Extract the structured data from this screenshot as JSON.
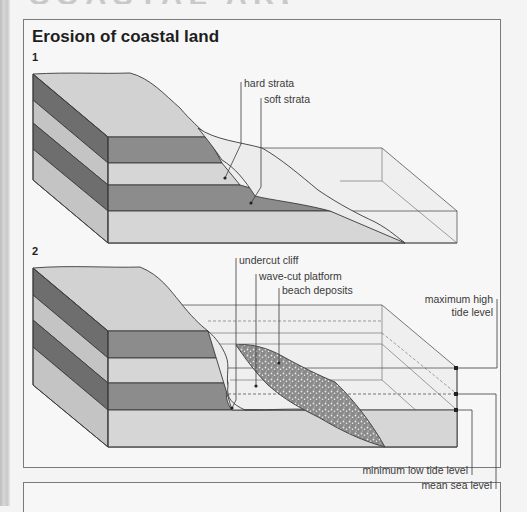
{
  "page": {
    "title": "Erosion of coastal land",
    "top_fragment": "COASTAL AREAS"
  },
  "colors": {
    "dark_strata": "#8c8c8c",
    "dark_strata_side": "#6e6e6e",
    "light_strata": "#d6d6d6",
    "light_strata_side": "#c4c4c4",
    "top_surface": "#d2d2d2",
    "water": "#ececec",
    "beach": "#9a9a9a",
    "outline": "#3a3a3a"
  },
  "diagrams": [
    {
      "number": "1",
      "labels": [
        {
          "id": "hard-strata",
          "text": "hard strata"
        },
        {
          "id": "soft-strata",
          "text": "soft strata"
        }
      ]
    },
    {
      "number": "2",
      "labels": [
        {
          "id": "undercut-cliff",
          "text": "undercut cliff"
        },
        {
          "id": "wave-cut-platform",
          "text": "wave-cut platform"
        },
        {
          "id": "beach-deposits",
          "text": "beach deposits"
        },
        {
          "id": "maximum-high-tide-level",
          "text": "maximum high",
          "text2": "tide level"
        },
        {
          "id": "minimum-low-tide-level",
          "text": "minimum low tide level"
        },
        {
          "id": "mean-sea-level",
          "text": "mean sea level"
        }
      ]
    }
  ]
}
